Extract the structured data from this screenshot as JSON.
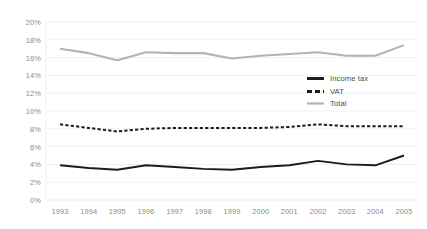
{
  "chart_data": {
    "type": "line",
    "title": "",
    "subtitle": "",
    "xlabel": "",
    "ylabel": "",
    "categories": [
      "1993",
      "1994",
      "1995",
      "1996",
      "1997",
      "1998",
      "1999",
      "2000",
      "2001",
      "2002",
      "2003",
      "2004",
      "2005"
    ],
    "x": [
      1993,
      1994,
      1995,
      1996,
      1997,
      1998,
      1999,
      2000,
      2001,
      2002,
      2003,
      2004,
      2005
    ],
    "ylim": [
      0,
      20
    ],
    "ytick_values": [
      0,
      2,
      4,
      6,
      8,
      10,
      12,
      14,
      16,
      18,
      20
    ],
    "ytick_labels": [
      "0%",
      "2%",
      "4%",
      "6%",
      "8%",
      "10%",
      "12%",
      "14%",
      "16%",
      "18%",
      "20%"
    ],
    "y_unit": "%",
    "grid": true,
    "grid_axis": "y",
    "legend_position": "center-right-inside",
    "series": [
      {
        "name": "Income tax",
        "style": "solid",
        "color": "#1c1c1c",
        "values": [
          3.9,
          3.6,
          3.4,
          3.9,
          3.7,
          3.5,
          3.4,
          3.7,
          3.9,
          4.4,
          4.0,
          3.9,
          5.0
        ]
      },
      {
        "name": "VAT",
        "style": "dashed",
        "color": "#1c1c1c",
        "values": [
          8.5,
          8.1,
          7.7,
          8.0,
          8.1,
          8.1,
          8.1,
          8.1,
          8.2,
          8.5,
          8.3,
          8.3,
          8.3
        ]
      },
      {
        "name": "Total",
        "style": "solid",
        "color": "#b3b3b3",
        "values": [
          17.0,
          16.5,
          15.7,
          16.6,
          16.5,
          16.5,
          15.9,
          16.2,
          16.4,
          16.6,
          16.2,
          16.2,
          17.4
        ]
      }
    ]
  },
  "legend": {
    "items": [
      {
        "label": "Income tax",
        "swatch": "solid-black-line-swatch"
      },
      {
        "label": "VAT",
        "swatch": "dashed-black-line-swatch"
      },
      {
        "label": "Total",
        "swatch": "solid-gray-line-swatch"
      }
    ]
  },
  "colors": {
    "background": "#ffffff",
    "gridline": "#f0f0f0",
    "axis_text": "#8a8a8a",
    "legend_text": "#4a4a4a",
    "income_tax": "#1c1c1c",
    "vat": "#1c1c1c",
    "total": "#b3b3b3"
  }
}
